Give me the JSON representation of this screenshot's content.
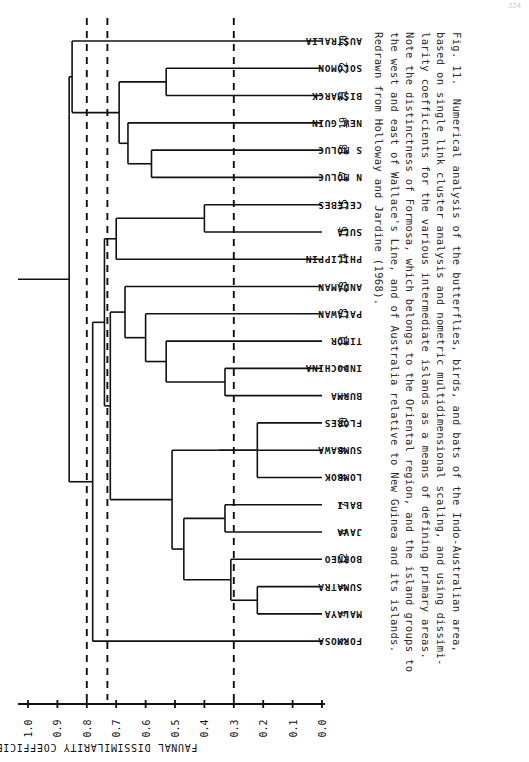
{
  "page_number": "224",
  "figure": {
    "number": "Fig. 11.",
    "caption_lines": [
      "Fig. 11.  Numerical analysis of the butterflies, birds, and bats of the Indo-Australian area,",
      "based on single link cluster analysis and nometric multidimensional scaling, and using dissimi-",
      "larity coefficients for the various intermediate islands as a means of defining primary areas.",
      "Note the distinctness of Formosa, which belongs to the Oriental region, and the island groups to",
      "the west and east of Wallace's Line, and of Australia relative to New Guinea and its islands.",
      "Redrawn from Holloway and Jardine (1968)."
    ]
  },
  "axis": {
    "title": "FAUNAL DISSIMILARITY COEFFICIENT",
    "ticks": [
      "1.0",
      "0.9",
      "0.8",
      "0.7",
      "0.6",
      "0.5",
      "0.4",
      "0.3",
      "0.2",
      "0.1",
      "0.0"
    ],
    "range_max": 1.0,
    "range_min": 0.0,
    "direction": "decreasing-left-to-right"
  },
  "reference_lines": [
    {
      "name": "dashed-line-0.80",
      "value": 0.8
    },
    {
      "name": "dashed-line-0.73",
      "value": 0.73
    },
    {
      "name": "dashed-line-0.30",
      "value": 0.3
    }
  ],
  "chart_data": {
    "type": "dendrogram",
    "title": "Numerical analysis of the butterflies, birds, and bats of the Indo-Australian area",
    "xlabel": "FAUNAL DISSIMILARITY COEFFICIENT",
    "ylabel": "",
    "xlim": [
      1.0,
      0.0
    ],
    "grid": false,
    "legend": "none",
    "leaf_order_top_to_bottom": [
      {
        "index": "20",
        "label": "AUSTRALIA"
      },
      {
        "index": "22",
        "label": "SOLOMON"
      },
      {
        "index": "21",
        "label": "BISMARCK"
      },
      {
        "index": "19",
        "label": "NEW GUIN"
      },
      {
        "index": "18",
        "label": "S MOLUC"
      },
      {
        "index": "17",
        "label": "N MOLUC"
      },
      {
        "index": "15",
        "label": "CELEBES"
      },
      {
        "index": "16",
        "label": "SULA"
      },
      {
        "index": "14",
        "label": "PHILIPPIN"
      },
      {
        "index": "23",
        "label": "ANDAMAN"
      },
      {
        "index": "13",
        "label": "PALAWAN"
      },
      {
        "index": "11",
        "label": "TIMOR"
      },
      {
        "index": "2",
        "label": "INDOCHINA"
      },
      {
        "index": "1",
        "label": "BURMA"
      },
      {
        "index": "10",
        "label": "FLORES"
      },
      {
        "index": "9",
        "label": "SUMBAWA"
      },
      {
        "index": "8",
        "label": "LOMBOK"
      },
      {
        "index": "7",
        "label": "BALI"
      },
      {
        "index": "6",
        "label": "JAVA"
      },
      {
        "index": "12",
        "label": "BORNEO"
      },
      {
        "index": "5",
        "label": "SUMATRA"
      },
      {
        "index": "4",
        "label": "MALAYA"
      },
      {
        "index": "3",
        "label": "FORMOSA"
      }
    ],
    "merges": [
      {
        "name": "solomon-bismarck",
        "members": [
          "22",
          "21"
        ],
        "height": 0.53
      },
      {
        "name": "s-moluc-n-moluc",
        "members": [
          "18",
          "17"
        ],
        "height": 0.58
      },
      {
        "name": "moluccas-new-guinea",
        "members": [
          "19",
          "18+17"
        ],
        "height": 0.66
      },
      {
        "name": "papuan-core",
        "members": [
          "22+21",
          "19+18+17"
        ],
        "height": 0.69
      },
      {
        "name": "australia-papuan",
        "members": [
          "20",
          "papuan-core"
        ],
        "height": 0.85
      },
      {
        "name": "celebes-sula",
        "members": [
          "15",
          "16"
        ],
        "height": 0.4
      },
      {
        "name": "wallacea-philippines",
        "members": [
          "15+16",
          "14"
        ],
        "height": 0.7
      },
      {
        "name": "indochina-burma",
        "members": [
          "2",
          "1"
        ],
        "height": 0.33
      },
      {
        "name": "oriental-timor",
        "members": [
          "11",
          "2+1"
        ],
        "height": 0.53
      },
      {
        "name": "palawan-join",
        "members": [
          "13",
          "oriental-timor"
        ],
        "height": 0.6
      },
      {
        "name": "andaman-join",
        "members": [
          "23",
          "palawan-join"
        ],
        "height": 0.67
      },
      {
        "name": "flores-lombok",
        "members": [
          "10",
          "8"
        ],
        "height": 0.22
      },
      {
        "name": "sumbawa-join",
        "members": [
          "9",
          "10+8"
        ],
        "height": 0.35
      },
      {
        "name": "bali-java",
        "members": [
          "7",
          "6"
        ],
        "height": 0.33
      },
      {
        "name": "sumatra-malaya",
        "members": [
          "5",
          "4"
        ],
        "height": 0.22
      },
      {
        "name": "borneo-sumatra-malaya",
        "members": [
          "12",
          "5+4"
        ],
        "height": 0.31
      },
      {
        "name": "greater-sunda",
        "members": [
          "7+6",
          "12+5+4"
        ],
        "height": 0.47
      },
      {
        "name": "sunda-lesser-sunda",
        "members": [
          "sumbawa-join",
          "greater-sunda"
        ],
        "height": 0.51
      },
      {
        "name": "oriental-assembly",
        "members": [
          "andaman-join",
          "sunda-lesser-sunda"
        ],
        "height": 0.72
      },
      {
        "name": "oriental-wallacea",
        "members": [
          "wallacea-philippines",
          "oriental-assembly"
        ],
        "height": 0.74
      },
      {
        "name": "formosa-join",
        "members": [
          "3",
          "oriental-wallacea"
        ],
        "height": 0.78
      },
      {
        "name": "root",
        "members": [
          "australia-papuan",
          "formosa-join"
        ],
        "height": 0.86
      }
    ]
  }
}
